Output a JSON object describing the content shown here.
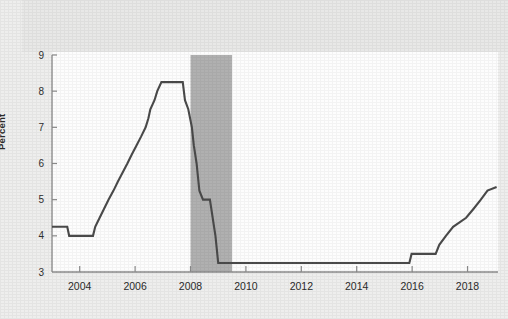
{
  "chart_data": {
    "type": "line",
    "title": "",
    "xlabel": "",
    "ylabel": "Percent",
    "xlim": [
      2003.0,
      2019.1
    ],
    "ylim": [
      3,
      9
    ],
    "yticks": [
      3,
      4,
      5,
      6,
      7,
      8,
      9
    ],
    "ytick_labels": [
      "3",
      "4",
      "5",
      "6",
      "7",
      "8",
      "9"
    ],
    "xticks": [
      2004,
      2006,
      2008,
      2010,
      2012,
      2014,
      2016,
      2018
    ],
    "xtick_labels": [
      "2004",
      "2006",
      "2008",
      "2010",
      "2012",
      "2014",
      "2016",
      "2018"
    ],
    "grid": false,
    "legend": "none",
    "line_color": "#4a4a4a",
    "line_width": 2.1,
    "recession_band": {
      "label": "recession",
      "start": 2008.0,
      "end": 2009.5,
      "color": "#b0b0b0"
    },
    "series": [
      {
        "name": "Prime Rate",
        "points": [
          [
            2003.0,
            4.25
          ],
          [
            2003.55,
            4.25
          ],
          [
            2003.62,
            4.0
          ],
          [
            2004.48,
            4.0
          ],
          [
            2004.56,
            4.25
          ],
          [
            2004.72,
            4.5
          ],
          [
            2004.88,
            4.75
          ],
          [
            2005.04,
            5.0
          ],
          [
            2005.22,
            5.25
          ],
          [
            2005.38,
            5.5
          ],
          [
            2005.55,
            5.75
          ],
          [
            2005.72,
            6.0
          ],
          [
            2005.88,
            6.25
          ],
          [
            2006.05,
            6.5
          ],
          [
            2006.22,
            6.75
          ],
          [
            2006.38,
            7.0
          ],
          [
            2006.48,
            7.25
          ],
          [
            2006.55,
            7.5
          ],
          [
            2006.7,
            7.75
          ],
          [
            2006.8,
            8.0
          ],
          [
            2006.95,
            8.25
          ],
          [
            2007.72,
            8.25
          ],
          [
            2007.8,
            7.75
          ],
          [
            2007.92,
            7.5
          ],
          [
            2008.05,
            7.0
          ],
          [
            2008.12,
            6.5
          ],
          [
            2008.22,
            6.0
          ],
          [
            2008.32,
            5.25
          ],
          [
            2008.45,
            5.0
          ],
          [
            2008.7,
            5.0
          ],
          [
            2008.8,
            4.5
          ],
          [
            2008.9,
            4.0
          ],
          [
            2009.0,
            3.25
          ],
          [
            2015.9,
            3.25
          ],
          [
            2015.98,
            3.5
          ],
          [
            2016.85,
            3.5
          ],
          [
            2016.98,
            3.75
          ],
          [
            2017.22,
            4.0
          ],
          [
            2017.48,
            4.25
          ],
          [
            2017.95,
            4.5
          ],
          [
            2018.22,
            4.75
          ],
          [
            2018.48,
            5.0
          ],
          [
            2018.72,
            5.25
          ],
          [
            2019.05,
            5.35
          ]
        ]
      }
    ]
  },
  "axis": {
    "y_title": "Percent"
  }
}
